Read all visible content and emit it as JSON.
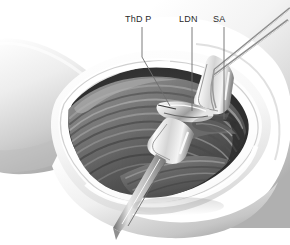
{
  "figure": {
    "kind": "surgical-anatomy-illustration",
    "background_color": "#ffffff",
    "palette": {
      "ink": "#2b2b2b",
      "leader_line": "#6e6e6e",
      "skin_light": "#f2f2f2",
      "skin_mid": "#d9d9d9",
      "skin_shadow": "#a8a8a8",
      "fascia_white": "#fbfbfb",
      "muscle_light": "#8f8f8f",
      "muscle_mid": "#6a6a6a",
      "muscle_dark": "#3f3f3f",
      "cavity_deep": "#2e2e2e",
      "metal_light": "#f6f6f6",
      "metal_mid": "#c9c9c9",
      "metal_dark": "#7d7d7d"
    }
  },
  "labels": [
    {
      "id": "thdp",
      "text": "ThD P",
      "leader": {
        "type": "elbow",
        "points": "142,27 142,57 170,106"
      }
    },
    {
      "id": "ldn",
      "text": "LDN",
      "leader": {
        "type": "straight",
        "points": "192,27 192,111"
      }
    },
    {
      "id": "sa",
      "text": "SA",
      "leader": {
        "type": "straight",
        "points": "224,27 224,119"
      }
    }
  ],
  "instruments": [
    {
      "id": "retractor-blade",
      "name": "hand-held-retractor",
      "label": ""
    },
    {
      "id": "forceps-upper",
      "name": "dissecting-forceps",
      "label": ""
    },
    {
      "id": "scissors-probe",
      "name": "fine-instrument-tips",
      "label": ""
    }
  ],
  "structures": [
    {
      "id": "arm",
      "name": "upper-arm"
    },
    {
      "id": "wound",
      "name": "surgical-wound-opening"
    },
    {
      "id": "muscle-belly",
      "name": "muscle-belly"
    },
    {
      "id": "cavity",
      "name": "deep-cavity"
    }
  ]
}
